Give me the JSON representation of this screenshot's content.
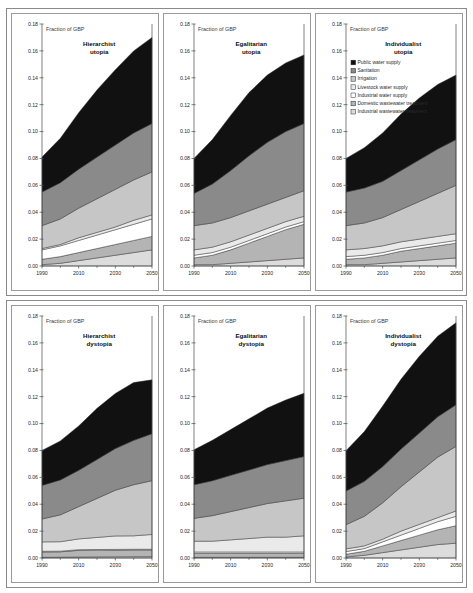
{
  "figure": {
    "name": "water-services-cost-scenarios",
    "rows": [
      {
        "name": "utopia-row",
        "panels": [
          0,
          1,
          2
        ]
      },
      {
        "name": "dystopia-row",
        "panels": [
          3,
          4,
          5
        ]
      }
    ]
  },
  "legend": {
    "position": "panel-3-top-left",
    "entries": [
      {
        "label": "Public water supply",
        "color": "#111111"
      },
      {
        "label": "Sanitation",
        "color": "#8a8a8a"
      },
      {
        "label": "Irrigation",
        "color": "#c6c6c6"
      },
      {
        "label": "Livestock water supply",
        "color": "#eaeaea"
      },
      {
        "label": "Industrial water supply",
        "color": "#ffffff"
      },
      {
        "label": "Domestic wastewater treatment",
        "color": "#b4b4b4"
      },
      {
        "label": "Industrial wastewater treatment",
        "color": "#dcdcdc"
      }
    ]
  },
  "axis": {
    "ylabel": "Fraction of GBP",
    "ylim": [
      0.0,
      0.18
    ],
    "yticks": [
      0.0,
      0.02,
      0.04,
      0.06,
      0.08,
      0.1,
      0.12,
      0.14,
      0.16,
      0.18
    ],
    "ytick_labels": [
      "0.00",
      "0.02",
      "0.04",
      "0.06",
      "0.08",
      "0.10",
      "0.12",
      "0.14",
      "0.16",
      "0.18"
    ],
    "xlim": [
      1990,
      2050
    ],
    "xticks": [
      1990,
      2010,
      2030,
      2050
    ],
    "xtick_labels": [
      "1990",
      "2010",
      "2030",
      "2050"
    ],
    "xminor_ticks": [
      2000,
      2020,
      2040
    ],
    "grid": false
  },
  "chart_data": {
    "type": "area",
    "xlabel": "",
    "ylabel": "Fraction of GBP",
    "ylim": [
      0.0,
      0.18
    ],
    "xlim": [
      1990,
      2050
    ],
    "grid": false,
    "legend_position": "panel-3-top-left",
    "stack_order_bottom_to_top": [
      "Industrial wastewater treatment",
      "Domestic wastewater treatment",
      "Industrial water supply",
      "Livestock water supply",
      "Irrigation",
      "Sanitation",
      "Public water supply"
    ],
    "x": [
      1990,
      2000,
      2010,
      2020,
      2030,
      2040,
      2050
    ],
    "panels": [
      {
        "name": "hierarchist-utopia",
        "title_line1": "Hierarchist",
        "title_line2": "utopia",
        "total_2050": 0.17,
        "series": [
          {
            "name": "Industrial wastewater treatment",
            "color": "#dcdcdc",
            "values": [
              0.001,
              0.002,
              0.004,
              0.006,
              0.008,
              0.01,
              0.012
            ]
          },
          {
            "name": "Domestic wastewater treatment",
            "color": "#b4b4b4",
            "values": [
              0.004,
              0.005,
              0.006,
              0.007,
              0.008,
              0.009,
              0.01
            ]
          },
          {
            "name": "Industrial water supply",
            "color": "#ffffff",
            "values": [
              0.007,
              0.008,
              0.009,
              0.01,
              0.011,
              0.012,
              0.013
            ]
          },
          {
            "name": "Livestock water supply",
            "color": "#eaeaea",
            "values": [
              0.001,
              0.001,
              0.002,
              0.002,
              0.002,
              0.003,
              0.003
            ]
          },
          {
            "name": "Irrigation",
            "color": "#c6c6c6",
            "values": [
              0.017,
              0.019,
              0.022,
              0.025,
              0.028,
              0.03,
              0.032
            ]
          },
          {
            "name": "Sanitation",
            "color": "#8a8a8a",
            "values": [
              0.025,
              0.027,
              0.029,
              0.031,
              0.033,
              0.035,
              0.036
            ]
          },
          {
            "name": "Public water supply",
            "color": "#111111",
            "values": [
              0.026,
              0.033,
              0.042,
              0.05,
              0.056,
              0.061,
              0.064
            ]
          }
        ]
      },
      {
        "name": "egalitarian-utopia",
        "title_line1": "Egalitarian",
        "title_line2": "utopia",
        "total_2050": 0.152,
        "series": [
          {
            "name": "Industrial wastewater treatment",
            "color": "#dcdcdc",
            "values": [
              0.001,
              0.001,
              0.002,
              0.003,
              0.004,
              0.005,
              0.006
            ]
          },
          {
            "name": "Domestic wastewater treatment",
            "color": "#b4b4b4",
            "values": [
              0.005,
              0.007,
              0.01,
              0.014,
              0.018,
              0.022,
              0.025
            ]
          },
          {
            "name": "Industrial water supply",
            "color": "#ffffff",
            "values": [
              0.002,
              0.002,
              0.002,
              0.002,
              0.002,
              0.002,
              0.002
            ]
          },
          {
            "name": "Livestock water supply",
            "color": "#eaeaea",
            "values": [
              0.004,
              0.004,
              0.004,
              0.004,
              0.004,
              0.004,
              0.004
            ]
          },
          {
            "name": "Irrigation",
            "color": "#c6c6c6",
            "values": [
              0.018,
              0.018,
              0.018,
              0.018,
              0.018,
              0.018,
              0.019
            ]
          },
          {
            "name": "Sanitation",
            "color": "#8a8a8a",
            "values": [
              0.024,
              0.029,
              0.035,
              0.041,
              0.046,
              0.049,
              0.05
            ]
          },
          {
            "name": "Public water supply",
            "color": "#111111",
            "values": [
              0.026,
              0.033,
              0.041,
              0.047,
              0.05,
              0.051,
              0.051
            ]
          }
        ]
      },
      {
        "name": "individualist-utopia",
        "title_line1": "Individualist",
        "title_line2": "utopia",
        "total_2050": 0.142,
        "series": [
          {
            "name": "Industrial wastewater treatment",
            "color": "#dcdcdc",
            "values": [
              0.001,
              0.001,
              0.002,
              0.003,
              0.004,
              0.005,
              0.006
            ]
          },
          {
            "name": "Domestic wastewater treatment",
            "color": "#b4b4b4",
            "values": [
              0.004,
              0.005,
              0.006,
              0.008,
              0.009,
              0.01,
              0.011
            ]
          },
          {
            "name": "Industrial water supply",
            "color": "#ffffff",
            "values": [
              0.002,
              0.002,
              0.002,
              0.002,
              0.002,
              0.002,
              0.002
            ]
          },
          {
            "name": "Livestock water supply",
            "color": "#eaeaea",
            "values": [
              0.005,
              0.005,
              0.005,
              0.005,
              0.005,
              0.005,
              0.005
            ]
          },
          {
            "name": "Irrigation",
            "color": "#c6c6c6",
            "values": [
              0.018,
              0.019,
              0.021,
              0.024,
              0.028,
              0.032,
              0.036
            ]
          },
          {
            "name": "Sanitation",
            "color": "#8a8a8a",
            "values": [
              0.025,
              0.026,
              0.027,
              0.029,
              0.031,
              0.033,
              0.034
            ]
          },
          {
            "name": "Public water supply",
            "color": "#111111",
            "values": [
              0.025,
              0.03,
              0.036,
              0.042,
              0.046,
              0.048,
              0.048
            ]
          }
        ]
      },
      {
        "name": "hierarchist-dystopia",
        "title_line1": "Hierarchist",
        "title_line2": "dystopia",
        "total_2050": 0.132,
        "series": [
          {
            "name": "Industrial wastewater treatment",
            "color": "#dcdcdc",
            "values": [
              0.0005,
              0.0006,
              0.0007,
              0.0008,
              0.0009,
              0.001,
              0.001
            ]
          },
          {
            "name": "Domestic wastewater treatment",
            "color": "#b4b4b4",
            "values": [
              0.004,
              0.004,
              0.005,
              0.005,
              0.005,
              0.005,
              0.005
            ]
          },
          {
            "name": "Industrial water supply",
            "color": "#ffffff",
            "values": [
              0.0005,
              0.0005,
              0.0005,
              0.0005,
              0.0005,
              0.0005,
              0.0005
            ]
          },
          {
            "name": "Livestock water supply",
            "color": "#eaeaea",
            "values": [
              0.007,
              0.007,
              0.008,
              0.009,
              0.01,
              0.01,
              0.011
            ]
          },
          {
            "name": "Irrigation",
            "color": "#c6c6c6",
            "values": [
              0.017,
              0.02,
              0.024,
              0.029,
              0.034,
              0.038,
              0.04
            ]
          },
          {
            "name": "Sanitation",
            "color": "#8a8a8a",
            "values": [
              0.025,
              0.026,
              0.027,
              0.029,
              0.031,
              0.033,
              0.035
            ]
          },
          {
            "name": "Public water supply",
            "color": "#111111",
            "values": [
              0.026,
              0.029,
              0.033,
              0.038,
              0.041,
              0.043,
              0.04
            ]
          }
        ]
      },
      {
        "name": "egalitarian-dystopia",
        "title_line1": "Egalitarian",
        "title_line2": "dystopia",
        "total_2050": 0.122,
        "series": [
          {
            "name": "Industrial wastewater treatment",
            "color": "#dcdcdc",
            "values": [
              0.0005,
              0.0005,
              0.0005,
              0.0005,
              0.0005,
              0.0005,
              0.0005
            ]
          },
          {
            "name": "Domestic wastewater treatment",
            "color": "#b4b4b4",
            "values": [
              0.003,
              0.003,
              0.003,
              0.003,
              0.003,
              0.003,
              0.003
            ]
          },
          {
            "name": "Industrial water supply",
            "color": "#ffffff",
            "values": [
              0.001,
              0.001,
              0.001,
              0.001,
              0.001,
              0.001,
              0.001
            ]
          },
          {
            "name": "Livestock water supply",
            "color": "#eaeaea",
            "values": [
              0.008,
              0.008,
              0.009,
              0.01,
              0.011,
              0.011,
              0.012
            ]
          },
          {
            "name": "Irrigation",
            "color": "#c6c6c6",
            "values": [
              0.017,
              0.019,
              0.021,
              0.023,
              0.025,
              0.027,
              0.028
            ]
          },
          {
            "name": "Sanitation",
            "color": "#8a8a8a",
            "values": [
              0.025,
              0.026,
              0.027,
              0.028,
              0.029,
              0.03,
              0.031
            ]
          },
          {
            "name": "Public water supply",
            "color": "#111111",
            "values": [
              0.026,
              0.03,
              0.034,
              0.038,
              0.042,
              0.045,
              0.047
            ]
          }
        ]
      },
      {
        "name": "individualist-dystopia",
        "title_line1": "Individualist",
        "title_line2": "dystopia",
        "total_2050": 0.175,
        "series": [
          {
            "name": "Industrial wastewater treatment",
            "color": "#dcdcdc",
            "values": [
              0.0008,
              0.002,
              0.004,
              0.006,
              0.008,
              0.01,
              0.011
            ]
          },
          {
            "name": "Domestic wastewater treatment",
            "color": "#b4b4b4",
            "values": [
              0.002,
              0.003,
              0.005,
              0.007,
              0.009,
              0.011,
              0.013
            ]
          },
          {
            "name": "Industrial water supply",
            "color": "#ffffff",
            "values": [
              0.002,
              0.002,
              0.003,
              0.004,
              0.005,
              0.006,
              0.007
            ]
          },
          {
            "name": "Livestock water supply",
            "color": "#eaeaea",
            "values": [
              0.002,
              0.002,
              0.002,
              0.003,
              0.003,
              0.003,
              0.004
            ]
          },
          {
            "name": "Irrigation",
            "color": "#c6c6c6",
            "values": [
              0.018,
              0.022,
              0.027,
              0.033,
              0.039,
              0.045,
              0.048
            ]
          },
          {
            "name": "Sanitation",
            "color": "#8a8a8a",
            "values": [
              0.025,
              0.026,
              0.027,
              0.028,
              0.029,
              0.03,
              0.031
            ]
          },
          {
            "name": "Public water supply",
            "color": "#111111",
            "values": [
              0.03,
              0.037,
              0.045,
              0.052,
              0.057,
              0.06,
              0.061
            ]
          }
        ]
      }
    ]
  }
}
